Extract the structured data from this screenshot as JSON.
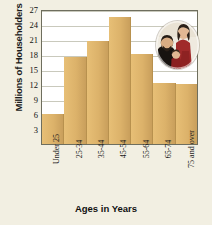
{
  "chart_data": {
    "type": "bar",
    "title": "",
    "xlabel": "Ages in Years",
    "ylabel": "Millions of Householders",
    "categories": [
      "Under 25",
      "25-34",
      "35-44",
      "45-54",
      "55-64",
      "65-74",
      "75 and over"
    ],
    "values": [
      6,
      17.4,
      20.7,
      25.5,
      18,
      12.3,
      12
    ],
    "ylim": [
      0,
      27
    ],
    "yticks": [
      3,
      6,
      9,
      12,
      15,
      18,
      21,
      24,
      27
    ],
    "grid": true,
    "legend": "none",
    "bar_color": "#dcb26a",
    "plot_background": "#ffffff",
    "figure_background": "#f2efe2"
  },
  "inset": {
    "name": "family-photograph",
    "description": "Oval portrait photo of a family"
  }
}
